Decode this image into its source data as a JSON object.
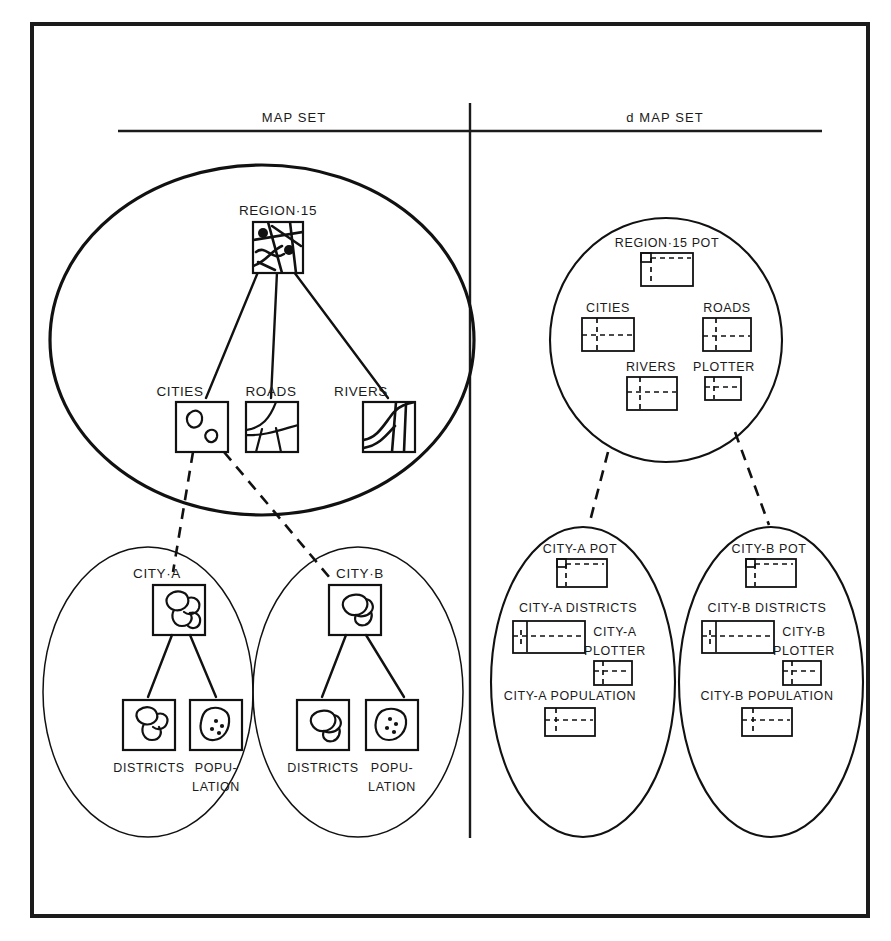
{
  "figure": {
    "background": "#ffffff",
    "ink": "#111111"
  },
  "headers": [
    {
      "id": "left",
      "label": "MAP SET"
    },
    {
      "id": "right",
      "label": "d MAP SET"
    }
  ],
  "left_panel": {
    "region_group": {
      "root": {
        "label": "REGION·15",
        "icon": "map-thumbnail-region"
      },
      "children": [
        {
          "label": "CITIES",
          "icon": "map-thumbnail-cities"
        },
        {
          "label": "ROADS",
          "icon": "map-thumbnail-roads"
        },
        {
          "label": "RIVERS",
          "icon": "map-thumbnail-rivers"
        }
      ]
    },
    "city_groups": [
      {
        "root": {
          "label": "CITY·A",
          "icon": "map-thumbnail-city-a"
        },
        "children": [
          {
            "label": "DISTRICTS",
            "icon": "map-thumbnail-districts-a"
          },
          {
            "label_line1": "POPU-",
            "label_line2": "LATION",
            "icon": "map-thumbnail-population-a"
          }
        ]
      },
      {
        "root": {
          "label": "CITY·B",
          "icon": "map-thumbnail-city-b"
        },
        "children": [
          {
            "label": "DISTRICTS",
            "icon": "map-thumbnail-districts-b"
          },
          {
            "label_line1": "POPU-",
            "label_line2": "LATION",
            "icon": "map-thumbnail-population-b"
          }
        ]
      }
    ]
  },
  "right_panel": {
    "region_group": {
      "items": [
        {
          "label": "REGION·15 POT",
          "icon": "data-structure-pot"
        },
        {
          "label": "CITIES",
          "icon": "data-structure-block"
        },
        {
          "label": "ROADS",
          "icon": "data-structure-block"
        },
        {
          "label": "RIVERS",
          "icon": "data-structure-block"
        },
        {
          "label": "PLOTTER",
          "icon": "data-structure-small"
        }
      ]
    },
    "city_groups": [
      {
        "items": [
          {
            "label": "CITY-A POT",
            "icon": "data-structure-pot"
          },
          {
            "label": "CITY-A DISTRICTS",
            "icon": "data-structure-districts"
          },
          {
            "label_line1": "CITY-A",
            "label_line2": "PLOTTER",
            "icon": "data-structure-small"
          },
          {
            "label": "CITY-A POPULATION",
            "icon": "data-structure-block"
          }
        ]
      },
      {
        "items": [
          {
            "label": "CITY-B POT",
            "icon": "data-structure-pot"
          },
          {
            "label": "CITY-B DISTRICTS",
            "icon": "data-structure-districts"
          },
          {
            "label_line1": "CITY-B",
            "label_line2": "PLOTTER",
            "icon": "data-structure-small"
          },
          {
            "label": "CITY-B POPULATION",
            "icon": "data-structure-block"
          }
        ]
      }
    ]
  }
}
